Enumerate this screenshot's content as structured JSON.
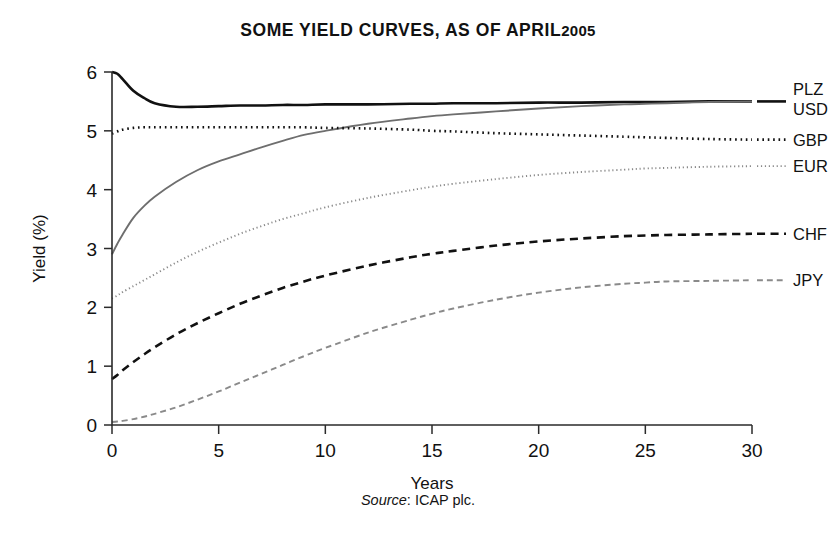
{
  "figure": {
    "title_main": "SOME YIELD CURVES, AS OF APRIL",
    "title_year": "2005",
    "source_word": "Source",
    "source_rest": ": ICAP plc."
  },
  "chart_data": {
    "type": "line",
    "xlabel": "Years",
    "ylabel": "Yield (%)",
    "xlim": [
      0,
      30
    ],
    "ylim": [
      0,
      6
    ],
    "xticks": [
      0,
      5,
      10,
      15,
      20,
      25,
      30
    ],
    "yticks": [
      0,
      1,
      2,
      3,
      4,
      5,
      6
    ],
    "xtick_labels": [
      "0",
      "5",
      "10",
      "15",
      "20",
      "25",
      "30"
    ],
    "ytick_labels": [
      "0",
      "1",
      "2",
      "3",
      "4",
      "5",
      "6"
    ],
    "grid": false,
    "legend_position": "right",
    "x": [
      0,
      0.25,
      0.5,
      1,
      1.5,
      2,
      3,
      4,
      5,
      6,
      7,
      8,
      9,
      10,
      12,
      14,
      15,
      16,
      18,
      20,
      22,
      24,
      25,
      26,
      28,
      30
    ],
    "series": [
      {
        "name": "PLZ",
        "color": "#111111",
        "style": "solid",
        "width": 2.6,
        "values": [
          6.0,
          5.97,
          5.88,
          5.68,
          5.56,
          5.47,
          5.41,
          5.41,
          5.42,
          5.43,
          5.43,
          5.44,
          5.44,
          5.45,
          5.45,
          5.46,
          5.46,
          5.47,
          5.47,
          5.48,
          5.48,
          5.49,
          5.49,
          5.49,
          5.5,
          5.5
        ]
      },
      {
        "name": "USD",
        "color": "#6e6e6e",
        "style": "solid",
        "width": 1.9,
        "values": [
          2.9,
          3.08,
          3.24,
          3.52,
          3.72,
          3.88,
          4.13,
          4.33,
          4.48,
          4.6,
          4.72,
          4.83,
          4.93,
          5.0,
          5.12,
          5.21,
          5.25,
          5.28,
          5.33,
          5.38,
          5.42,
          5.45,
          5.46,
          5.47,
          5.49,
          5.5
        ]
      },
      {
        "name": "GBP",
        "color": "#111111",
        "style": "dotted",
        "width": 2.6,
        "values": [
          4.95,
          4.99,
          5.02,
          5.05,
          5.06,
          5.06,
          5.06,
          5.06,
          5.06,
          5.06,
          5.06,
          5.06,
          5.06,
          5.05,
          5.04,
          5.02,
          5.0,
          4.99,
          4.96,
          4.94,
          4.92,
          4.9,
          4.89,
          4.88,
          4.86,
          4.85
        ]
      },
      {
        "name": "EUR",
        "color": "#8a8a8a",
        "style": "dotted",
        "width": 1.9,
        "values": [
          2.15,
          2.2,
          2.26,
          2.36,
          2.46,
          2.56,
          2.76,
          2.94,
          3.1,
          3.25,
          3.38,
          3.5,
          3.6,
          3.7,
          3.86,
          3.99,
          4.05,
          4.1,
          4.18,
          4.25,
          4.3,
          4.34,
          4.36,
          4.37,
          4.39,
          4.4
        ]
      },
      {
        "name": "CHF",
        "color": "#111111",
        "style": "dashed",
        "width": 2.6,
        "values": [
          0.78,
          0.85,
          0.93,
          1.07,
          1.2,
          1.32,
          1.54,
          1.73,
          1.9,
          2.06,
          2.2,
          2.33,
          2.44,
          2.54,
          2.71,
          2.85,
          2.91,
          2.96,
          3.05,
          3.12,
          3.17,
          3.21,
          3.22,
          3.23,
          3.24,
          3.25
        ]
      },
      {
        "name": "JPY",
        "color": "#8a8a8a",
        "style": "dashed",
        "width": 1.9,
        "values": [
          0.05,
          0.06,
          0.07,
          0.1,
          0.14,
          0.19,
          0.3,
          0.43,
          0.57,
          0.72,
          0.87,
          1.02,
          1.17,
          1.31,
          1.57,
          1.79,
          1.89,
          1.98,
          2.13,
          2.25,
          2.34,
          2.4,
          2.42,
          2.44,
          2.45,
          2.46
        ]
      }
    ],
    "legend_entries": [
      {
        "name": "PLZ",
        "y_value": 5.5
      },
      {
        "name": "USD",
        "y_value": 5.5
      },
      {
        "name": "GBP",
        "y_value": 4.85
      },
      {
        "name": "EUR",
        "y_value": 4.4
      },
      {
        "name": "CHF",
        "y_value": 3.25
      },
      {
        "name": "JPY",
        "y_value": 2.46
      }
    ]
  }
}
